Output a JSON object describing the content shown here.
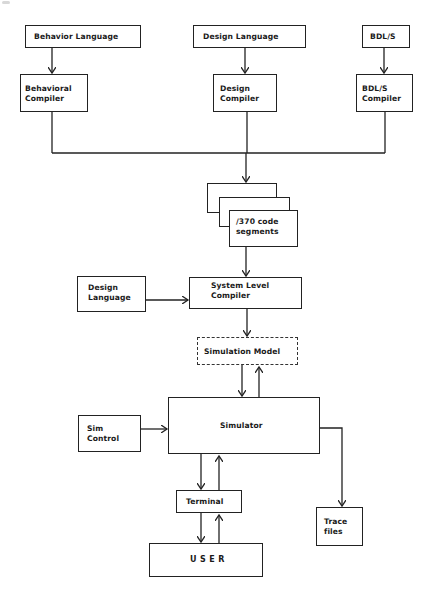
{
  "diagram": {
    "sources": {
      "behavior_language": "Behavior Language",
      "design_language_top": "Design Language",
      "bdls": "BDL/S"
    },
    "compilers": {
      "behavioral_compiler": "Behavioral\nCompiler",
      "design_compiler": "Design\nCompiler",
      "bdls_compiler": "BDL/S\nCompiler"
    },
    "code_segments": "/370 code\nsegments",
    "design_language_side": "Design\nLanguage",
    "system_level_compiler": "System Level\nCompiler",
    "simulation_model": "Simulation Model",
    "sim_control": "Sim\nControl",
    "simulator": "Simulator",
    "terminal": "Terminal",
    "user": "USER",
    "trace_files": "Trace\nfiles"
  },
  "colors": {
    "line": "#222222",
    "background": "#ffffff"
  }
}
